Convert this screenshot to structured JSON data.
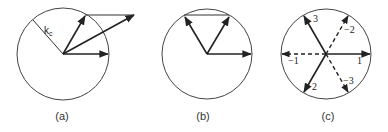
{
  "figure": {
    "panels": [
      {
        "id": "a",
        "caption": "(a)",
        "radius_label": "k",
        "radius_label_sub": "c",
        "description": "Circle of radius k_c with two wave vectors on the circle summing to a vector outside the circle"
      },
      {
        "id": "b",
        "caption": "(b)",
        "description": "Circle with three wave vectors on the circle forming a triad (equilateral)"
      },
      {
        "id": "c",
        "caption": "(c)",
        "vector_labels": [
          "1",
          "-1",
          "2",
          "-2",
          "3",
          "-3"
        ],
        "description": "Hexagonal arrangement: three vectors 1, 2, 3 (solid) and their negatives -1, -2, -3 (dashed)"
      }
    ],
    "colors": {
      "stroke": "#222222",
      "circle": "#444444",
      "background": "#ffffff"
    }
  }
}
